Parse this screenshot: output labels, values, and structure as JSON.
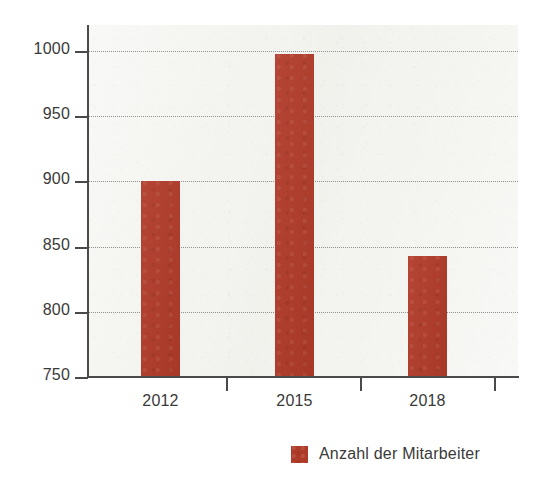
{
  "chart_data": {
    "type": "bar",
    "title": "",
    "subtitle": "",
    "xlabel": "",
    "ylabel": "",
    "categories": [
      "2012",
      "2015",
      "2018"
    ],
    "values": [
      900,
      998,
      843
    ],
    "series": [
      {
        "name": "Anzahl der Mitarbeiter",
        "color": "#b03a28",
        "values": [
          900,
          998,
          843
        ]
      }
    ],
    "ylim": [
      750,
      1020
    ],
    "y_ticks": [
      750,
      800,
      850,
      900,
      950,
      1000
    ],
    "y_tick_labels": [
      "750",
      "800",
      "850",
      "900",
      "950",
      "1000"
    ],
    "x_tick_labels": [
      "2012",
      "2015",
      "2018"
    ],
    "grid": true,
    "grid_axis": "y",
    "grid_style": "dotted",
    "legend": {
      "position": "bottom-right",
      "entries": [
        {
          "label": "Anzahl der Mitarbeiter",
          "color": "#b03a28"
        }
      ]
    },
    "colors": {
      "bar": "#b03a28",
      "plot_background": "#f3f3ef",
      "page_background": "#ffffff",
      "axis": "#4a4a48",
      "grid": "#8b8b88",
      "text": "#3a3a38"
    }
  }
}
